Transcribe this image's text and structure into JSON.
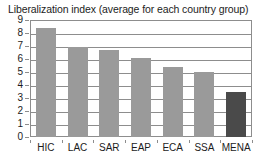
{
  "chart_data": {
    "type": "bar",
    "title": "Liberalization index (average for each country group)",
    "xlabel": "",
    "ylabel": "",
    "categories": [
      "HIC",
      "LAC",
      "SAR",
      "EAP",
      "ECA",
      "SSA",
      "MENA"
    ],
    "values": [
      8.4,
      6.9,
      6.7,
      6.1,
      5.4,
      5.0,
      3.45
    ],
    "ylim": [
      0,
      9
    ],
    "yticks": [
      0,
      1,
      2,
      3,
      4,
      5,
      6,
      7,
      8,
      9
    ],
    "ytick_labels": [
      "0",
      "1",
      "2",
      "3",
      "4",
      "5",
      "6",
      "7",
      "8",
      "9"
    ],
    "grid": true,
    "grid_axis": "y",
    "legend": false,
    "bar_colors": [
      "#9a9a9a",
      "#9a9a9a",
      "#9a9a9a",
      "#9a9a9a",
      "#9a9a9a",
      "#9a9a9a",
      "#4a4a4a"
    ],
    "colors": {
      "bar_default": "#9a9a9a",
      "bar_highlight": "#4a4a4a",
      "axis": "#8d8d8d",
      "text": "#1c1c1c",
      "background": "#ffffff"
    }
  }
}
